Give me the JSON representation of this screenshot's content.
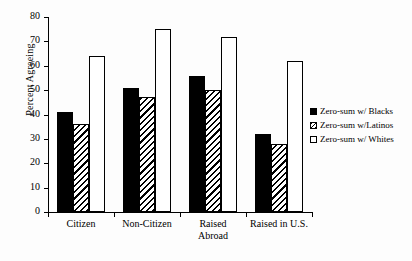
{
  "chart_data": {
    "type": "bar",
    "title": "",
    "subtitle": "",
    "xlabel": "",
    "ylabel": "Percent Agreeing",
    "ylim": [
      0,
      80
    ],
    "yticks": [
      0,
      10,
      20,
      30,
      40,
      50,
      60,
      70,
      80
    ],
    "ytick_labels": [
      "0",
      "10",
      "20",
      "30",
      "40",
      "50",
      "60",
      "70",
      "80"
    ],
    "grid": false,
    "legend_position": "right",
    "categories": [
      "Citizen",
      "Non-Citizen",
      "Raised\nAbroad",
      "Raised in U.S."
    ],
    "category_labels": [
      "Citizen",
      "Non-Citizen",
      "Raised Abroad",
      "Raised in U.S."
    ],
    "series": [
      {
        "name": "Zero-sum w/ Blacks",
        "fill": "solid-black",
        "color": "#000000",
        "values": [
          41,
          51,
          56,
          32
        ]
      },
      {
        "name": "Zero-sum w/Latinos",
        "fill": "diagonal-hatch",
        "color": "#ffffff",
        "values": [
          36,
          47,
          50,
          28
        ]
      },
      {
        "name": "Zero-sum w/ Whites",
        "fill": "open-white",
        "color": "#ffffff",
        "values": [
          64,
          75,
          72,
          62
        ]
      }
    ]
  },
  "legend": {
    "items": [
      {
        "label": "Zero-sum w/ Blacks"
      },
      {
        "label": "Zero-sum w/Latinos"
      },
      {
        "label": "Zero-sum w/ Whites"
      }
    ]
  }
}
